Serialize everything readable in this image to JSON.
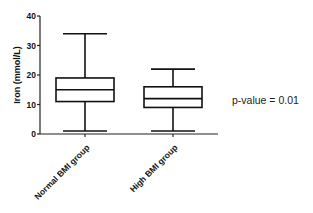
{
  "chart_data": {
    "type": "box",
    "title": "",
    "xlabel": "",
    "ylabel": "Iron  (mmol/L)",
    "ylim": [
      0,
      40
    ],
    "yticks": [
      0,
      10,
      20,
      30,
      40
    ],
    "grid": false,
    "categories": [
      "Normal BMI  group",
      "High BMI group"
    ],
    "series": [
      {
        "name": "Normal BMI  group",
        "min": 1,
        "q1": 11,
        "median": 15,
        "q3": 19,
        "max": 34
      },
      {
        "name": "High BMI group",
        "min": 1,
        "q1": 9,
        "median": 12,
        "q3": 16,
        "max": 22
      }
    ],
    "annotations": [
      "p-value = 0.01"
    ]
  },
  "axis": {
    "ylabel": "Iron  (mmol/L)",
    "ticks": [
      "0",
      "10",
      "20",
      "30",
      "40"
    ]
  },
  "labels": {
    "cat0": "Normal BMI  group",
    "cat1": "High BMI group",
    "pvalue": "p-value = 0.01"
  }
}
